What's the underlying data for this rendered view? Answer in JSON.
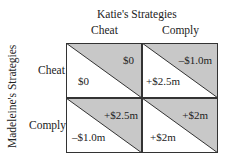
{
  "title": "Katie's Strategies",
  "row_player_label": "Madeleine's Strategies",
  "columns": [
    "Cheat",
    "Comply"
  ],
  "rows": [
    "Cheat",
    "Comply"
  ],
  "colors": {
    "shade": "#c8c8c8",
    "line": "#333333",
    "background": "#ffffff"
  },
  "cells": [
    {
      "row": "Cheat",
      "col": "Cheat",
      "katie": "$0",
      "madeleine": "$0"
    },
    {
      "row": "Cheat",
      "col": "Comply",
      "katie": "–$1.0m",
      "madeleine": "+$2.5m"
    },
    {
      "row": "Comply",
      "col": "Cheat",
      "katie": "+$2.5m",
      "madeleine": "–$1.0m"
    },
    {
      "row": "Comply",
      "col": "Comply",
      "katie": "+$2m",
      "madeleine": "+$2m"
    }
  ]
}
